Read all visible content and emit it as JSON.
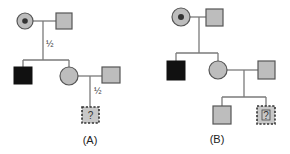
{
  "panels": [
    {
      "id": "A",
      "caption": "(A)",
      "probability_labels": [
        "½",
        "½"
      ],
      "individuals": [
        {
          "role": "grandmother",
          "sex": "female",
          "status": "carrier"
        },
        {
          "role": "grandfather",
          "sex": "male",
          "status": "unaffected-gray"
        },
        {
          "role": "son",
          "sex": "male",
          "status": "affected"
        },
        {
          "role": "daughter",
          "sex": "female",
          "status": "unaffected-gray"
        },
        {
          "role": "daughter-spouse",
          "sex": "male",
          "status": "unaffected-gray"
        },
        {
          "role": "grandson",
          "sex": "male",
          "status": "unknown",
          "label": "?"
        }
      ]
    },
    {
      "id": "B",
      "caption": "(B)",
      "individuals": [
        {
          "role": "grandmother",
          "sex": "female",
          "status": "carrier"
        },
        {
          "role": "grandfather",
          "sex": "male",
          "status": "unaffected-gray"
        },
        {
          "role": "son",
          "sex": "male",
          "status": "affected"
        },
        {
          "role": "daughter",
          "sex": "female",
          "status": "unaffected-gray"
        },
        {
          "role": "daughter-spouse",
          "sex": "male",
          "status": "unaffected-gray"
        },
        {
          "role": "grandson-1",
          "sex": "male",
          "status": "unaffected-gray"
        },
        {
          "role": "grandson-2",
          "sex": "male",
          "status": "unknown",
          "label": "?"
        }
      ]
    }
  ],
  "colors": {
    "line": "#7a7a7a",
    "unaffected": "#bdbdbd",
    "affected": "#111111",
    "unknown": "#c8c8c8"
  }
}
